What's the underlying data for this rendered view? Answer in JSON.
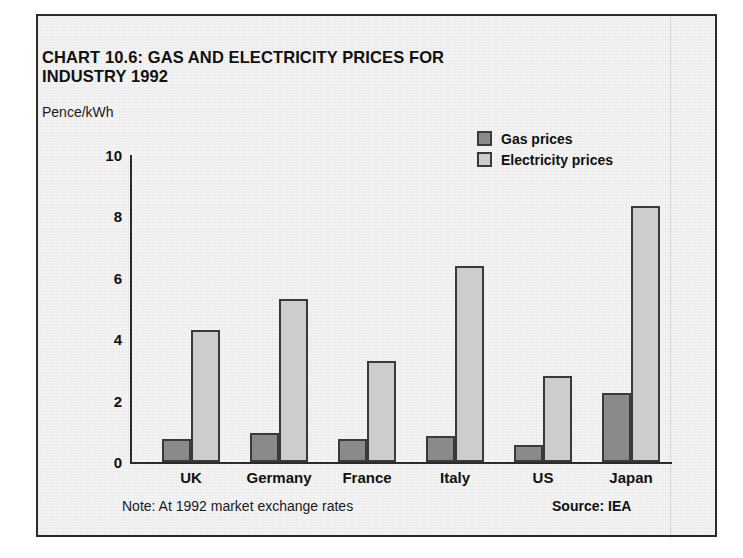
{
  "panel": {
    "title_line1": "CHART 10.6: GAS AND ELECTRICITY PRICES FOR",
    "title_line2": "INDUSTRY 1992",
    "unit_label": "Pence/kWh",
    "footer_note": "Note: At 1992 market exchange rates",
    "footer_source": "Source: IEA"
  },
  "legend": {
    "position": "top-right",
    "items": [
      {
        "label": "Gas prices",
        "color": "#8a8a8a",
        "icon": "square-swatch-icon"
      },
      {
        "label": "Electricity prices",
        "color": "#cdcdcd",
        "icon": "square-swatch-icon"
      }
    ]
  },
  "axis": {
    "y_ticks": [
      "10",
      "8",
      "6",
      "4",
      "2",
      "0"
    ],
    "x_categories": [
      "UK",
      "Germany",
      "France",
      "Italy",
      "US",
      "Japan"
    ]
  },
  "colors": {
    "gas": "#8a8a8a",
    "electricity": "#cdcdcd",
    "outline": "#3a3a3a",
    "axis": "#2b2b2b",
    "panel_background": "#f4f4f4",
    "text": "#111111"
  },
  "chart_data": {
    "type": "bar",
    "title": "CHART 10.6: GAS AND ELECTRICITY PRICES FOR INDUSTRY 1992",
    "subtitle": "",
    "xlabel": "",
    "ylabel": "Pence/kWh",
    "ylim": [
      0,
      10
    ],
    "ytick_values": [
      0,
      2,
      4,
      6,
      8,
      10
    ],
    "grid": false,
    "legend_position": "top-right",
    "annotations": [
      "Note: At 1992 market exchange rates",
      "Source: IEA"
    ],
    "categories": [
      "UK",
      "Germany",
      "France",
      "Italy",
      "US",
      "Japan"
    ],
    "series": [
      {
        "name": "Gas prices",
        "color": "#8a8a8a",
        "values": [
          0.75,
          0.95,
          0.75,
          0.85,
          0.55,
          2.25
        ]
      },
      {
        "name": "Electricity prices",
        "color": "#cdcdcd",
        "values": [
          4.3,
          5.3,
          3.3,
          6.4,
          2.8,
          8.35
        ]
      }
    ]
  }
}
